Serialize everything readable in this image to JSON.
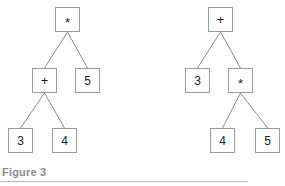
{
  "figure": {
    "caption": "Figure 3",
    "width": 285,
    "height": 186,
    "background_color": "#ffffff",
    "node_border_color": "#9a9a9a",
    "edge_color": "#8d8d8d",
    "label_color": "#1b1b1b",
    "caption_color": "#8a8a8a",
    "rule_color": "#b8b8b8"
  },
  "trees": [
    {
      "id": "left-tree",
      "expression": "(3 + 4) * 5",
      "nodes": [
        {
          "id": "L0",
          "label": "*",
          "kind": "operator",
          "x": 55,
          "y": 7,
          "level": 0
        },
        {
          "id": "L1",
          "label": "+",
          "kind": "operator",
          "x": 32,
          "y": 68,
          "level": 1
        },
        {
          "id": "L2",
          "label": "5",
          "kind": "leaf",
          "x": 75,
          "y": 68,
          "level": 1
        },
        {
          "id": "L3",
          "label": "3",
          "kind": "leaf",
          "x": 8,
          "y": 128,
          "level": 2
        },
        {
          "id": "L4",
          "label": "4",
          "kind": "leaf",
          "x": 52,
          "y": 128,
          "level": 2
        }
      ],
      "edges": [
        {
          "from": "L0",
          "to": "L1",
          "x1": 67.5,
          "y1": 32,
          "x2": 44.5,
          "y2": 68
        },
        {
          "from": "L0",
          "to": "L2",
          "x1": 67.5,
          "y1": 32,
          "x2": 87.5,
          "y2": 68
        },
        {
          "from": "L1",
          "to": "L3",
          "x1": 44.5,
          "y1": 93,
          "x2": 20.5,
          "y2": 128
        },
        {
          "from": "L1",
          "to": "L4",
          "x1": 44.5,
          "y1": 93,
          "x2": 64.5,
          "y2": 128
        }
      ]
    },
    {
      "id": "right-tree",
      "expression": "3 + (4 * 5)",
      "nodes": [
        {
          "id": "R0",
          "label": "+",
          "kind": "operator",
          "x": 208,
          "y": 7,
          "level": 0
        },
        {
          "id": "R1",
          "label": "3",
          "kind": "leaf",
          "x": 185,
          "y": 68,
          "level": 1
        },
        {
          "id": "R2",
          "label": "*",
          "kind": "operator",
          "x": 228,
          "y": 68,
          "level": 1
        },
        {
          "id": "R3",
          "label": "4",
          "kind": "leaf",
          "x": 210,
          "y": 128,
          "level": 2
        },
        {
          "id": "R4",
          "label": "5",
          "kind": "leaf",
          "x": 255,
          "y": 128,
          "level": 2
        }
      ],
      "edges": [
        {
          "from": "R0",
          "to": "R1",
          "x1": 220.5,
          "y1": 32,
          "x2": 197.5,
          "y2": 68
        },
        {
          "from": "R0",
          "to": "R2",
          "x1": 220.5,
          "y1": 32,
          "x2": 240.5,
          "y2": 68
        },
        {
          "from": "R2",
          "to": "R3",
          "x1": 240.5,
          "y1": 93,
          "x2": 222.5,
          "y2": 128
        },
        {
          "from": "R2",
          "to": "R4",
          "x1": 240.5,
          "y1": 93,
          "x2": 267.5,
          "y2": 128
        }
      ]
    }
  ]
}
